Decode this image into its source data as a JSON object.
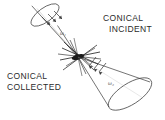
{
  "figure": {
    "name": "conical-incident-conical-collected-geometry",
    "background_color": "#ffffff",
    "line_color": "#3a3a3a",
    "text_color": "#2b2b2b",
    "width": 165,
    "height": 120
  },
  "labels": {
    "incident": {
      "line1": "CONICAL",
      "line2": "INCIDENT"
    },
    "collected": {
      "line1": "CONICAL",
      "line2": "COLLECTED"
    }
  },
  "annotations": {
    "incident_angle": "ω₁",
    "collected_angle": "ω₂"
  },
  "geometry": {
    "apex": {
      "x": 78,
      "y": 57
    },
    "incident_cone": {
      "role": "incident-beam-cone",
      "opens_toward": "upper-left",
      "base_center": {
        "x": 45,
        "y": 15
      },
      "base_rx": 16,
      "base_ry": 7,
      "base_rotation_deg": -35,
      "arrow_direction": "toward-apex"
    },
    "collected_cone": {
      "role": "collected-beam-cone",
      "opens_toward": "lower-right",
      "base_center": {
        "x": 132,
        "y": 94
      },
      "base_rx": 24,
      "base_ry": 11,
      "base_rotation_deg": -32,
      "arrow_direction": "away-from-apex"
    },
    "scatter_rays": 9
  }
}
